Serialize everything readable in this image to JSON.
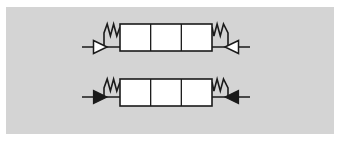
{
  "figure": {
    "background_color": "#ffffff",
    "panel": {
      "name": "gray-panel",
      "fill_color": "#d4d4d4",
      "x": 6,
      "y": 7,
      "width": 328,
      "height": 127
    },
    "line_color": "#1a1a1a",
    "body_fill_color": "#ffffff",
    "rows": [
      {
        "id": "row-top",
        "label": "top-assembly",
        "arrow_style": "hollow",
        "baseline_y": 47,
        "body": {
          "x": 120,
          "y": 24,
          "width": 92,
          "height": 27,
          "cells": 3,
          "fill": "#ffffff"
        },
        "springs": [
          {
            "side": "left",
            "coils": 2,
            "x_start": 104,
            "x_end": 120,
            "top_y": 24,
            "amplitude": 12
          },
          {
            "side": "right",
            "coils": 2,
            "x_start": 212,
            "x_end": 228,
            "top_y": 24,
            "amplitude": 12
          }
        ],
        "arrows": [
          {
            "id": "arrow-top-left",
            "direction": "right",
            "fill": "#ffffff",
            "tail_x": 82,
            "tip_x": 107,
            "size": 9
          },
          {
            "id": "arrow-top-right",
            "direction": "left",
            "fill": "#ffffff",
            "tail_x": 250,
            "tip_x": 225,
            "size": 9
          }
        ],
        "connector": {
          "x_start": 82,
          "x_end": 250
        }
      },
      {
        "id": "row-bottom",
        "label": "bottom-assembly",
        "arrow_style": "solid",
        "baseline_y": 97,
        "body": {
          "x": 120,
          "y": 79,
          "width": 92,
          "height": 27,
          "cells": 3,
          "fill": "#ffffff"
        },
        "springs": [
          {
            "side": "left",
            "coils": 2,
            "x_start": 104,
            "x_end": 120,
            "top_y": 79,
            "amplitude": 12
          },
          {
            "side": "right",
            "coils": 2,
            "x_start": 212,
            "x_end": 228,
            "top_y": 79,
            "amplitude": 12
          }
        ],
        "arrows": [
          {
            "id": "arrow-bottom-left",
            "direction": "right",
            "fill": "#1a1a1a",
            "tail_x": 82,
            "tip_x": 107,
            "size": 9
          },
          {
            "id": "arrow-bottom-right",
            "direction": "left",
            "fill": "#1a1a1a",
            "tail_x": 250,
            "tip_x": 225,
            "size": 9
          }
        ],
        "connector": {
          "x_start": 82,
          "x_end": 250
        }
      }
    ]
  }
}
